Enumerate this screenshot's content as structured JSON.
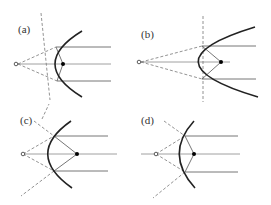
{
  "panels": [
    {
      "label": "(a)"
    },
    {
      "label": "(b)"
    },
    {
      "label": "(c)"
    },
    {
      "label": "(d)"
    }
  ],
  "legend": {
    "source_symbol": "open-circle",
    "focus_symbol": "filled-dot"
  }
}
